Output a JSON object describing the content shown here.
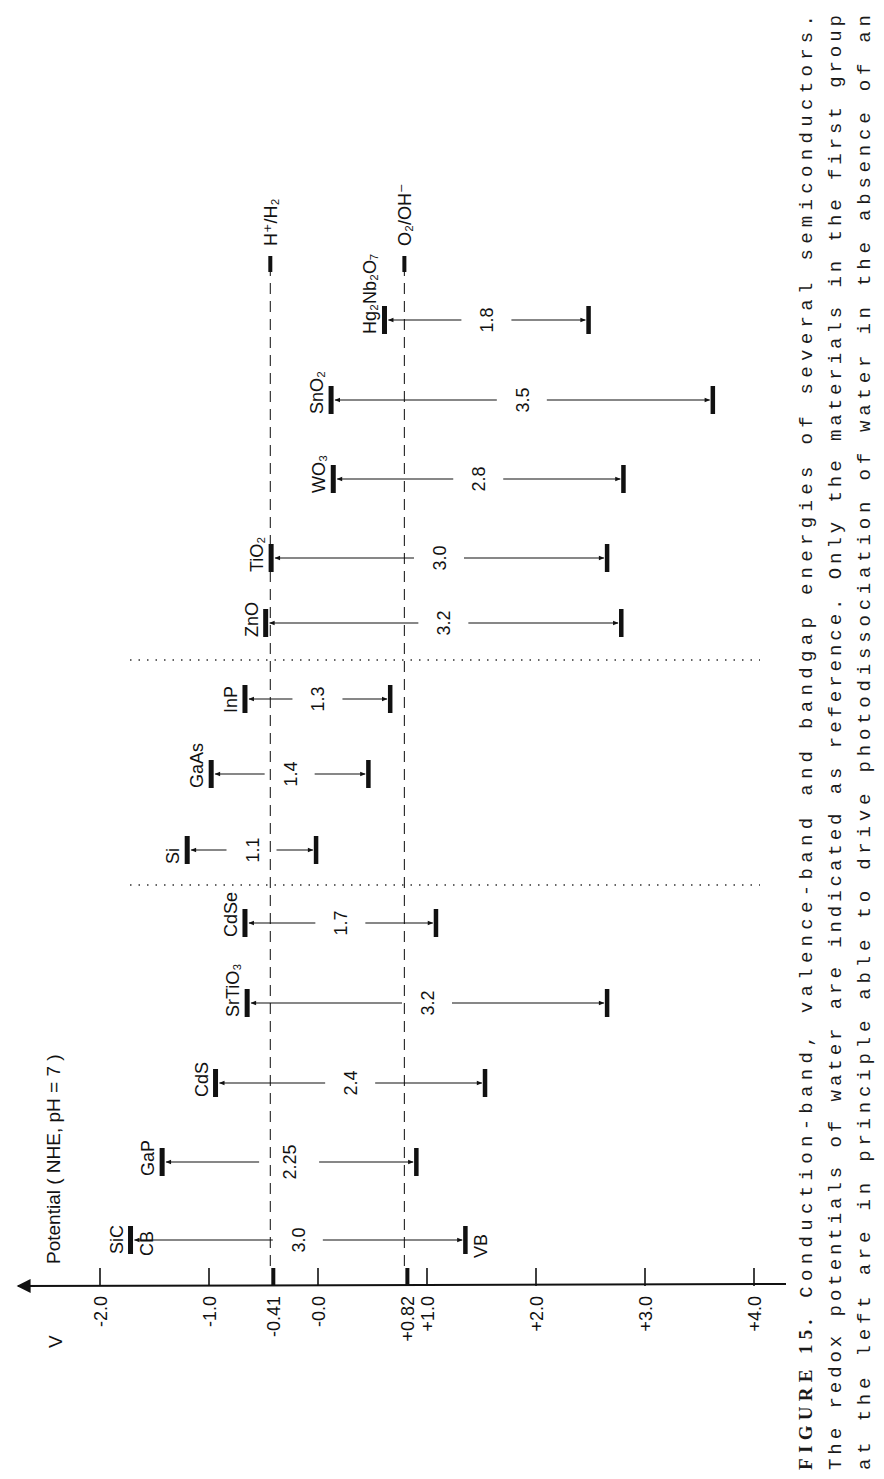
{
  "chart_data": {
    "type": "range-bar",
    "orientation_note": "Figure printed rotated 90° counter-clockwise; potential axis runs horizontally",
    "title": "Conduction-band, valence-band and bandgap energies of several semiconductors",
    "axis": {
      "unit_label": "V",
      "title": "Potential ( NHE, pH = 7 )",
      "ticks": [
        {
          "value": -2.0,
          "label": "-2.0"
        },
        {
          "value": -1.0,
          "label": "-1.0"
        },
        {
          "value": -0.41,
          "label": "-0.41",
          "bold": true
        },
        {
          "value": 0.0,
          "label": "-0.0"
        },
        {
          "value": 0.82,
          "label": "+0.82",
          "bold": true
        },
        {
          "value": 1.0,
          "label": "+1.0"
        },
        {
          "value": 2.0,
          "label": "+2.0"
        },
        {
          "value": 3.0,
          "label": "+3.0"
        },
        {
          "value": 4.0,
          "label": "+4.0"
        }
      ],
      "range": [
        -2.2,
        4.3
      ]
    },
    "reference_lines": [
      {
        "name": "H+/H2",
        "label": "H⁺/H₂",
        "value": -0.41,
        "style": "dashed"
      },
      {
        "name": "O2/OH-",
        "label": "O₂/OH⁻",
        "value": 0.82,
        "style": "dashed"
      }
    ],
    "band_labels": {
      "cb": "CB",
      "vb": "VB"
    },
    "groups": [
      {
        "name": "group-1",
        "materials": [
          {
            "name": "SiC",
            "label": "SiC",
            "cb": -1.72,
            "vb": 1.35,
            "gap": "3.0"
          },
          {
            "name": "GaP",
            "label": "GaP",
            "cb": -1.43,
            "vb": 0.9,
            "gap": "2.25"
          },
          {
            "name": "CdS",
            "label": "CdS",
            "cb": -0.94,
            "vb": 1.53,
            "gap": "2.4"
          },
          {
            "name": "SrTiO3",
            "label": "SrTiO₃",
            "cb": -0.65,
            "vb": 2.65,
            "gap": "3.2"
          },
          {
            "name": "CdSe",
            "label": "CdSe",
            "cb": -0.67,
            "vb": 1.08,
            "gap": "1.7"
          }
        ]
      },
      {
        "name": "group-2",
        "materials": [
          {
            "name": "Si",
            "label": "Si",
            "cb": -1.2,
            "vb": -0.02,
            "gap": "1.1"
          },
          {
            "name": "GaAs",
            "label": "GaAs",
            "cb": -0.98,
            "vb": 0.46,
            "gap": "1.4"
          },
          {
            "name": "InP",
            "label": "InP",
            "cb": -0.67,
            "vb": 0.66,
            "gap": "1.3"
          }
        ]
      },
      {
        "name": "group-3",
        "materials": [
          {
            "name": "ZnO",
            "label": "ZnO",
            "cb": -0.48,
            "vb": 2.78,
            "gap": "3.2"
          },
          {
            "name": "TiO2",
            "label": "TiO₂",
            "cb": -0.43,
            "vb": 2.65,
            "gap": "3.0"
          },
          {
            "name": "WO3",
            "label": "WO₃",
            "cb": 0.14,
            "vb": 2.8,
            "gap": "2.8"
          },
          {
            "name": "SnO2",
            "label": "SnO₂",
            "cb": 0.12,
            "vb": 3.62,
            "gap": "3.5"
          },
          {
            "name": "Hg2Nb2O7",
            "label": "Hg₂Nb₂O₇",
            "cb": 0.61,
            "vb": 2.48,
            "gap": "1.8"
          }
        ]
      }
    ]
  },
  "caption": {
    "figure_label": "FIGURE 15.",
    "lines": [
      "Conduction-band, valence-band and bandgap energies of several semiconductors.",
      "The redox potentials of water are indicated as reference.  Only the materials in the first group",
      "at the left are in principle able to drive photodissociation of water in the absence of an"
    ]
  },
  "layout": {
    "axis_y": 1286,
    "x0": 318,
    "px_per_volt": 109,
    "row_y": {
      "SiC": 1240,
      "GaP": 1162,
      "CdS": 1083,
      "SrTiO3": 1003,
      "CdSe": 923,
      "Si": 850,
      "GaAs": 774,
      "InP": 699,
      "ZnO": 623,
      "TiO2": 558,
      "WO3": 479,
      "SnO2": 400,
      "Hg2Nb2O7": 320
    },
    "separators_y": [
      885,
      660
    ],
    "colors": {
      "ink": "#111111",
      "caption": "#1a1a1a",
      "background": "#ffffff"
    }
  }
}
